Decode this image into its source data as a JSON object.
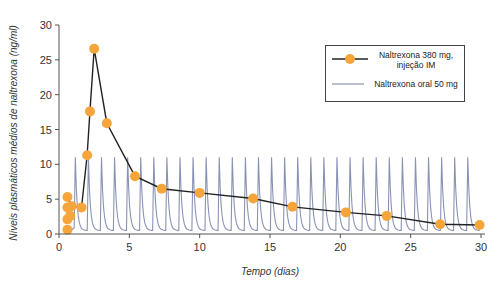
{
  "chart_data": {
    "type": "line",
    "title": "",
    "xlabel": "Tempo (dias)",
    "ylabel": "Níveis plasmáticos médios de naltrexona (ng/ml)",
    "xlim": [
      0,
      30
    ],
    "ylim": [
      0,
      30
    ],
    "xticks": [
      0,
      5,
      10,
      15,
      20,
      25,
      30
    ],
    "yticks": [
      0,
      5,
      10,
      15,
      20,
      25,
      30
    ],
    "grid": false,
    "legend_position": "upper right",
    "series": [
      {
        "name": "Naltrexona 380 mg, injeção IM",
        "style": "line+markers",
        "line_color": "#222222",
        "marker_color": "#f5a53a",
        "x": [
          0.6,
          0.6,
          0.6,
          0.6,
          0.8,
          0.9,
          1.6,
          2.0,
          2.2,
          2.5,
          3.4,
          5.4,
          7.3,
          10.0,
          13.8,
          16.6,
          20.4,
          23.3,
          27.1,
          29.9
        ],
        "y": [
          0.6,
          2.1,
          3.8,
          5.3,
          2.6,
          4.0,
          3.8,
          11.3,
          17.6,
          26.6,
          15.9,
          8.3,
          6.5,
          5.9,
          5.1,
          3.9,
          3.1,
          2.6,
          1.4,
          1.3
        ],
        "connected_x": [
          0.9,
          1.6,
          2.0,
          2.2,
          2.5,
          3.4,
          5.4,
          7.3,
          10.0,
          13.8,
          16.6,
          20.4,
          23.3,
          27.1,
          29.9
        ],
        "connected_y": [
          4.0,
          3.8,
          11.3,
          17.6,
          26.6,
          15.9,
          8.3,
          6.5,
          5.9,
          5.1,
          3.9,
          3.1,
          2.6,
          1.4,
          1.3
        ]
      },
      {
        "name": "Naltrexona oral 50 mg",
        "style": "line",
        "line_color": "#8a93b4",
        "pattern": "daily peaks",
        "peak_value": 11.0,
        "trough_value": 0.5,
        "first_dose_day": 1.1,
        "dose_interval_days": 0.93,
        "dose_count": 31
      }
    ]
  },
  "legend": {
    "items": [
      {
        "label_line1": "Naltrexona 380 mg,",
        "label_line2": "injeção IM"
      },
      {
        "label_line1": "Naltrexona oral 50 mg"
      }
    ]
  },
  "axes": {
    "x_ticks": [
      "0",
      "5",
      "10",
      "15",
      "20",
      "25",
      "30"
    ],
    "y_ticks": [
      "0",
      "5",
      "10",
      "15",
      "20",
      "25",
      "30"
    ],
    "xlabel": "Tempo (dias)",
    "ylabel": "Níveis plasmáticos médios de naltrexona (ng/ml)"
  }
}
